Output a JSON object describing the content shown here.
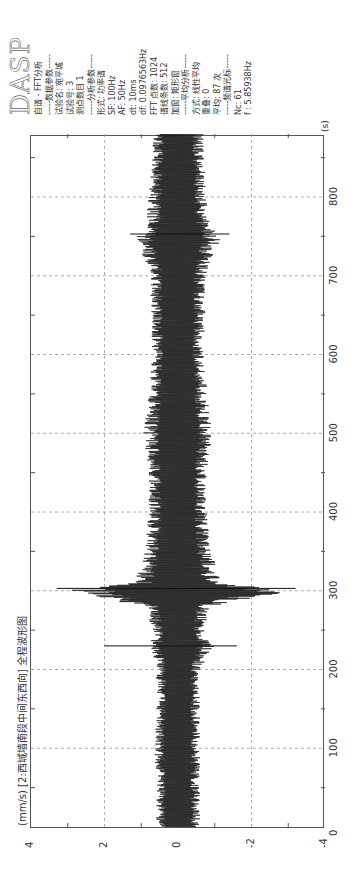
{
  "chart_data": {
    "type": "line",
    "title": "(mm/s) [2:西城墙南段中间东西向] 全程波形图",
    "xlabel": "(s)",
    "ylabel": "(mm/s)",
    "xlim": [
      0,
      880
    ],
    "ylim": [
      -4,
      4
    ],
    "x_ticks": [
      "0",
      "100",
      "200",
      "300",
      "400",
      "500",
      "600",
      "700",
      "800"
    ],
    "y_ticks": [
      "-4",
      "-2",
      "0",
      "2",
      "4"
    ],
    "grid": true,
    "series": [
      {
        "name": "2:西城墙南段中间东西向",
        "envelope_x": [
          0,
          50,
          100,
          150,
          200,
          230,
          250,
          280,
          300,
          310,
          350,
          400,
          450,
          500,
          550,
          600,
          650,
          700,
          750,
          760,
          800,
          850,
          880
        ],
        "envelope_max": [
          0.6,
          0.6,
          0.65,
          0.6,
          0.6,
          0.75,
          0.7,
          0.9,
          3.2,
          1.2,
          0.9,
          0.8,
          0.8,
          0.95,
          0.8,
          0.7,
          0.75,
          0.75,
          1.2,
          0.9,
          0.8,
          0.7,
          0.7
        ],
        "envelope_min": [
          -0.6,
          -0.6,
          -0.6,
          -0.6,
          -0.6,
          -1.0,
          -0.7,
          -0.9,
          -3.2,
          -1.2,
          -0.9,
          -0.8,
          -0.8,
          -0.95,
          -0.8,
          -0.7,
          -0.75,
          -0.75,
          -1.2,
          -0.9,
          -0.8,
          -0.7,
          -0.7
        ],
        "peaks": [
          {
            "x": 230,
            "y": 2.0
          },
          {
            "x": 230,
            "y": -1.6
          },
          {
            "x": 303,
            "y": 3.3
          },
          {
            "x": 303,
            "y": -3.2
          },
          {
            "x": 753,
            "y": 1.3
          },
          {
            "x": 753,
            "y": -1.4
          }
        ]
      }
    ]
  },
  "info_panel": {
    "logo": "DASP",
    "lines": [
      "自谱 - FFT分析",
      "-----数据参数-----",
      "试验名: 宛平城",
      "试验号: 3",
      "测点数目 1",
      "-----分析参数-----",
      "形式: 功率谱",
      "SF: 100Hz",
      "AF: 50Hz",
      "dt: 10ms",
      "df: 0.0976563Hz",
      "FFT 点数: 1024",
      "谱线条数: 512",
      "加窗: 矩形窗",
      "-----平均分析-----",
      "方式: 线性平均",
      "重叠: 0",
      "平均: 87 次",
      "-----频谱光标-----",
      "Nc: 61",
      "f : 5.85938Hz"
    ]
  }
}
